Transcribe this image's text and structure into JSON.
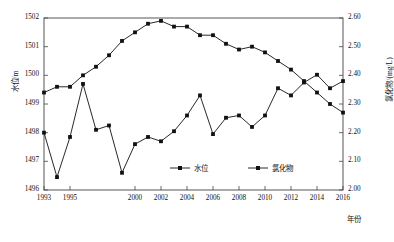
{
  "chart_data": {
    "type": "line",
    "title": "",
    "xlabel": "年份",
    "ylabel_left": "水位/m",
    "ylabel_right": "氯化物/(mg/L)",
    "grid": false,
    "legend_position": "bottom-center",
    "x": [
      1993,
      1994,
      1995,
      1996,
      1997,
      1998,
      1999,
      2000,
      2001,
      2002,
      2003,
      2004,
      2005,
      2006,
      2007,
      2008,
      2009,
      2010,
      2011,
      2012,
      2013,
      2014,
      2015,
      2016
    ],
    "xticks": [
      "1993",
      "1995",
      "2000",
      "2002",
      "2004",
      "2006",
      "2008",
      "2010",
      "2012",
      "2014",
      "2016"
    ],
    "ylim_left": [
      1496,
      1502
    ],
    "yticks_left": [
      "1496",
      "1497",
      "1498",
      "1499",
      "1500",
      "1501",
      "1502"
    ],
    "ylim_right": [
      2.0,
      2.6
    ],
    "yticks_right": [
      "2.00",
      "2.10",
      "2.20",
      "2.30",
      "2.40",
      "2.50",
      "2.60"
    ],
    "series": [
      {
        "name": "水位",
        "axis": "left",
        "unit": "m",
        "marker": "square",
        "color": "#111111",
        "values": [
          1498.0,
          1496.45,
          1497.85,
          1499.7,
          1498.1,
          1498.25,
          1496.6,
          1497.6,
          1497.85,
          1497.7,
          1498.05,
          1498.6,
          1499.3,
          1497.95,
          1498.52,
          1498.6,
          1498.2,
          1498.6,
          1499.55,
          1499.3,
          1499.75,
          1500.02,
          1499.55,
          1499.8
        ]
      },
      {
        "name": "氯化物",
        "axis": "right",
        "unit": "mg/L",
        "marker": "square",
        "color": "#111111",
        "values": [
          2.34,
          2.36,
          2.36,
          2.4,
          2.43,
          2.47,
          2.52,
          2.55,
          2.58,
          2.59,
          2.57,
          2.57,
          2.54,
          2.54,
          2.51,
          2.49,
          2.5,
          2.48,
          2.45,
          2.42,
          2.38,
          2.34,
          2.3,
          2.27
        ]
      }
    ],
    "legend": [
      {
        "label": "水位"
      },
      {
        "label": "氯化物"
      }
    ]
  }
}
